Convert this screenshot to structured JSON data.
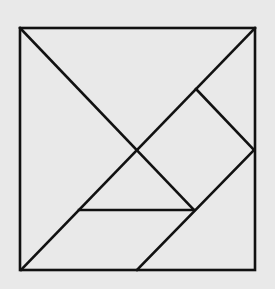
{
  "diagram": {
    "type": "tangram",
    "background": "#e9e9e9",
    "stroke": "#111111",
    "frame": {
      "x1": 20,
      "y1": 28,
      "x2": 255,
      "y2": 270
    },
    "lines": [
      {
        "name": "diagonal-top-left-to-bottom-right-piece",
        "x1": 20,
        "y1": 28,
        "x2": 194,
        "y2": 210
      },
      {
        "name": "diagonal-bottom-left-to-top-right",
        "x1": 21,
        "y1": 270,
        "x2": 255,
        "y2": 28
      },
      {
        "name": "square-right-edge",
        "x1": 196,
        "y1": 89,
        "x2": 254,
        "y2": 150
      },
      {
        "name": "lower-diagonal",
        "x1": 137,
        "y1": 270,
        "x2": 254,
        "y2": 150
      },
      {
        "name": "horizontal-mid-line",
        "x1": 79,
        "y1": 210,
        "x2": 194,
        "y2": 210
      }
    ],
    "pieces": [
      "large-triangle-top",
      "large-triangle-left",
      "small-triangle-right",
      "square",
      "small-triangle-middle",
      "parallelogram",
      "medium-triangle-bottom-right"
    ]
  }
}
